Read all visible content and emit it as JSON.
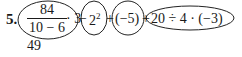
{
  "exercise": {
    "number": "5.",
    "fraction": {
      "numerator": "84",
      "denominator": "10 − 6"
    },
    "times_three": "· 3",
    "op1": "−",
    "power": {
      "base": "2",
      "exponent": "2"
    },
    "op2": "+",
    "neg_five": "(−5)",
    "op3": "+",
    "last_term": "20 ÷ 4 · (−3)",
    "answer": "49"
  }
}
